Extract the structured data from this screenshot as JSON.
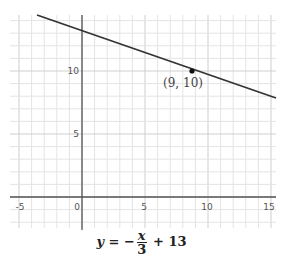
{
  "chart_data": {
    "type": "line",
    "title": "",
    "xlabel": "",
    "ylabel": "",
    "xlim": [
      -5.3,
      15.3
    ],
    "ylim": [
      -2.5,
      14.4
    ],
    "grid": true,
    "x_ticks": [
      "-5",
      "0",
      "5",
      "10",
      "15"
    ],
    "y_ticks": [
      "5",
      "10"
    ],
    "series": [
      {
        "name": "y = -x/3 + 13",
        "slope": -0.3333,
        "intercept": 13,
        "x": [
          -5.3,
          15.3
        ],
        "y": [
          14.77,
          7.9
        ]
      }
    ],
    "points": [
      {
        "x": 9,
        "y": 10,
        "label": "(9, 10)"
      }
    ],
    "annotations": [
      "(9, 10)"
    ],
    "equation": "y = -x/3 + 13"
  },
  "labels": {
    "x_ticks": [
      "-5",
      "0",
      "5",
      "10",
      "15"
    ],
    "y_5": "5",
    "y_10": "10",
    "point": "(9, 10)"
  },
  "equation": {
    "lhs": "y",
    "eq": " = −",
    "num": "x",
    "den": "3",
    "rest": " + 13"
  }
}
